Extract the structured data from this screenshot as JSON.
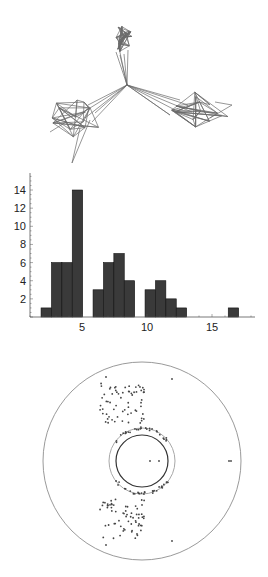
{
  "figure": {
    "panels": [
      "network-graph",
      "degree-histogram",
      "annulus-scatter"
    ]
  },
  "colors": {
    "edge": "#6a6a6a",
    "bar_fill": "#3a3a3a",
    "bar_stroke": "#111111",
    "axis": "#555555",
    "outer_circle": "#9a9a9a",
    "middle_ring": "#a8a8a8",
    "inner_circle": "#333333",
    "points": "#444444"
  },
  "chart_data": [
    {
      "type": "network",
      "title": "",
      "description": "Three-cluster graph drawing with a central hub joining the clusters",
      "clusters": [
        "top",
        "lower-left",
        "lower-right"
      ]
    },
    {
      "type": "bar",
      "title": "",
      "xlabel": "",
      "ylabel": "",
      "x_ticks": [
        5,
        10,
        15
      ],
      "y_ticks": [
        2,
        4,
        6,
        8,
        10,
        12,
        14
      ],
      "xlim": [
        0,
        18
      ],
      "ylim": [
        0,
        15
      ],
      "bars": [
        {
          "x": 2.25,
          "height": 1
        },
        {
          "x": 3.05,
          "height": 6
        },
        {
          "x": 3.85,
          "height": 6
        },
        {
          "x": 4.65,
          "height": 14
        },
        {
          "x": 6.25,
          "height": 3
        },
        {
          "x": 7.05,
          "height": 6
        },
        {
          "x": 7.85,
          "height": 7
        },
        {
          "x": 8.65,
          "height": 4
        },
        {
          "x": 10.25,
          "height": 3
        },
        {
          "x": 11.05,
          "height": 4
        },
        {
          "x": 11.85,
          "height": 2
        },
        {
          "x": 12.65,
          "height": 1
        },
        {
          "x": 16.65,
          "height": 1
        }
      ],
      "bin_width": 0.8,
      "categories": [
        "2.25",
        "3.05",
        "3.85",
        "4.65",
        "6.25",
        "7.05",
        "7.85",
        "8.65",
        "10.25",
        "11.05",
        "11.85",
        "12.65",
        "16.65"
      ],
      "values": [
        1,
        6,
        6,
        14,
        3,
        6,
        7,
        4,
        3,
        4,
        2,
        1,
        1
      ],
      "grid": false
    },
    {
      "type": "scatter",
      "title": "",
      "description": "Points scattered above and below an inner annulus inside a large outer circle",
      "circles": [
        {
          "name": "outer",
          "r": 99
        },
        {
          "name": "middle",
          "r": 33
        },
        {
          "name": "inner",
          "r": 26
        }
      ],
      "grid": false
    }
  ]
}
